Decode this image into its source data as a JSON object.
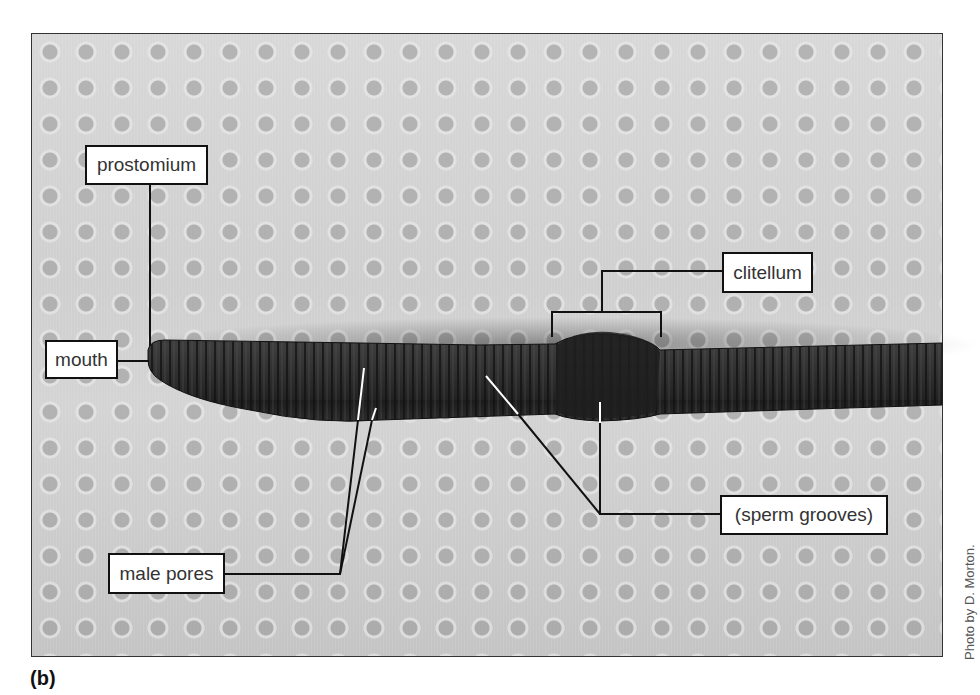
{
  "figure": {
    "panel_label": "(b)",
    "credit": "Photo by D. Morton.",
    "labels": {
      "prostomium": "prostomium",
      "mouth": "mouth",
      "clitellum": "clitellum",
      "sperm_grooves": "(sperm grooves)",
      "male_pores": "male pores"
    },
    "colors": {
      "label_border": "#111111",
      "label_bg": "#ffffff",
      "leader_line": "#111111",
      "pointer_tip": "#ffffff",
      "worm": "#2e2e2e",
      "background": "#cccccc"
    }
  }
}
